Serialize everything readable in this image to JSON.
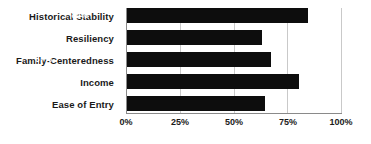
{
  "chart_data": {
    "type": "bar",
    "orientation": "horizontal",
    "title": "",
    "subtitle": "",
    "xlabel": "",
    "ylabel": "",
    "categories": [
      "Historical Stability",
      "Resiliency",
      "Family-Centeredness",
      "Income",
      "Ease of Entry"
    ],
    "values": [
      84,
      63,
      67,
      80,
      64
    ],
    "value_labels": [
      "84%",
      "63%",
      "67%",
      "80%",
      "64%"
    ],
    "xlim": [
      0,
      100
    ],
    "xticks": [
      0,
      25,
      50,
      75,
      100
    ],
    "xtick_labels": [
      "0%",
      "25%",
      "50%",
      "75%",
      "100%"
    ],
    "grid": true,
    "grid_axis": "x",
    "legend": false,
    "legend_position": "none",
    "bar_color": "#0d0d0d",
    "value_label_color": "#ffffff",
    "gridline_color": "#c9c9c9",
    "axis_color": "#8a8a8a",
    "background_color": "#ffffff"
  }
}
